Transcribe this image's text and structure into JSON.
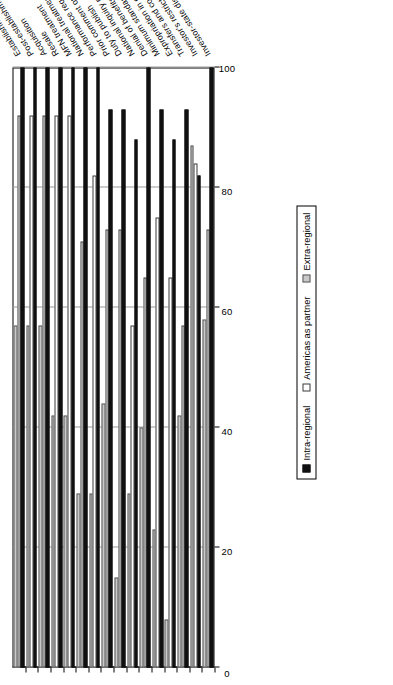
{
  "chart_data": {
    "type": "bar",
    "orientation": "horizontal-rotated",
    "title": "",
    "subtitle": "",
    "xlabel": "",
    "ylabel": "",
    "xlim": [
      0,
      100
    ],
    "axis_ticks": [
      "0",
      "20",
      "40",
      "60",
      "80",
      "100"
    ],
    "axis_tick_values": [
      0,
      20,
      40,
      60,
      80,
      100
    ],
    "grid": true,
    "legend_position": "right-outside",
    "categories": [
      "Establishment",
      "Post-establishment operation",
      "Acquisition",
      "Resale",
      "MFN treatment",
      "National treatment",
      "Performance requirements and board of directors",
      "Prior comment opportunity",
      "Duty to publish",
      "National inquiry point",
      "Denial of benefits",
      "Minimum standard of treatment",
      "Expropriation in case of conflict",
      "Transfers and compensation",
      "Investor's restrictions",
      "Investor-state disputes"
    ],
    "series": [
      {
        "name": "Intra-regional",
        "color": "#101010",
        "values": [
          100,
          100,
          100,
          100,
          100,
          100,
          100,
          93,
          93,
          88,
          100,
          93,
          88,
          93,
          82,
          100
        ]
      },
      {
        "name": "Americas as partner",
        "color": "#FFFFFF",
        "values": [
          92,
          92,
          92,
          92,
          92,
          71,
          82,
          73,
          73,
          57,
          65,
          75,
          65,
          57,
          84,
          73
        ]
      },
      {
        "name": "Extra-regional",
        "color": "#C9C9C9",
        "values": [
          57,
          57,
          57,
          42,
          42,
          29,
          29,
          44,
          15,
          29,
          40,
          23,
          8,
          42,
          87,
          58
        ]
      }
    ]
  },
  "legend": {
    "items": [
      {
        "label": "Intra-regional",
        "swatch": "intra"
      },
      {
        "label": "Americas as partner",
        "swatch": "amer"
      },
      {
        "label": "Extra-regional",
        "swatch": "extra"
      }
    ]
  }
}
